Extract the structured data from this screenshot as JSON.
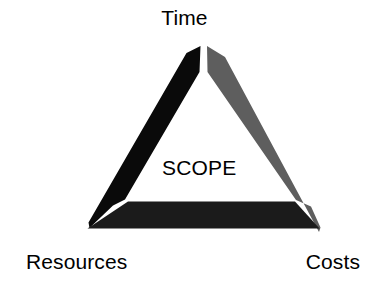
{
  "diagram": {
    "kind": "triple-constraint-triangle",
    "center_label": "SCOPE",
    "vertices": [
      {
        "id": "time",
        "label": "Time",
        "position": "top"
      },
      {
        "id": "resources",
        "label": "Resources",
        "position": "bottom-left"
      },
      {
        "id": "costs",
        "label": "Costs",
        "position": "bottom-right"
      }
    ],
    "sides": [
      {
        "id": "left-side",
        "from": "time",
        "to": "resources",
        "fill": "#0a0a0a"
      },
      {
        "id": "right-side",
        "from": "time",
        "to": "costs",
        "fill": "#5e5e5e"
      },
      {
        "id": "bottom-side",
        "from": "resources",
        "to": "costs",
        "fill": "#1b1b1b"
      }
    ],
    "colors": {
      "background": "#ffffff",
      "left_arm": "#0a0a0a",
      "right_arm": "#5e5e5e",
      "bottom_arm": "#1b1b1b",
      "text": "#000000"
    }
  }
}
